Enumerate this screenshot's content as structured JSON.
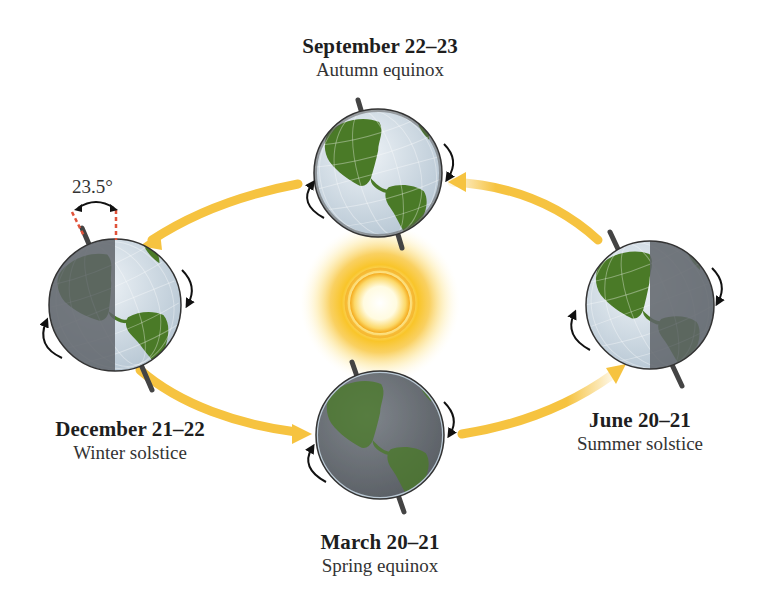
{
  "diagram": {
    "tilt_angle": "23.5°",
    "colors": {
      "orbit_arrow": "#f5c23a",
      "sun_core": "#fff7d6",
      "sun_glow": "#f7b21b",
      "ocean_lit": "#d5e1ea",
      "land": "#4d7a2a",
      "night_side": "#6b7076",
      "axis": "#444444",
      "tilt_guide": "#e0523a"
    },
    "positions": [
      {
        "id": "september",
        "date": "September 22–23",
        "name": "Autumn equinox"
      },
      {
        "id": "december",
        "date": "December 21–22",
        "name": "Winter solstice"
      },
      {
        "id": "march",
        "date": "March 20–21",
        "name": "Spring equinox"
      },
      {
        "id": "june",
        "date": "June 20–21",
        "name": "Summer solstice"
      }
    ],
    "center": {
      "label": "Sun"
    }
  }
}
